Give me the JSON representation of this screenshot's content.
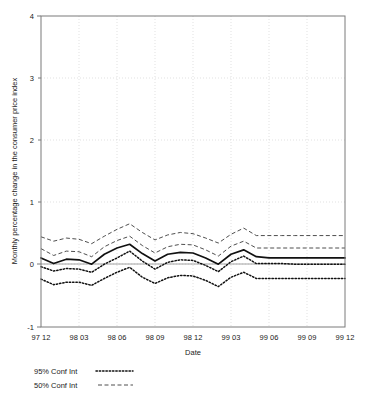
{
  "chart_data": {
    "type": "line",
    "title": "",
    "xlabel": "Date",
    "ylabel": "Monthly percentage change in the consumer price index",
    "ylim": [
      -1,
      4
    ],
    "yticks": [
      "-1",
      "0",
      "1",
      "2",
      "3",
      "4"
    ],
    "ytick_values": [
      -1,
      0,
      1,
      2,
      3,
      4
    ],
    "xticks": [
      "97 12",
      "98 03",
      "98 06",
      "98 09",
      "98 12",
      "99 03",
      "99 06",
      "99 09",
      "99 12"
    ],
    "xtick_values": [
      0,
      3,
      6,
      9,
      12,
      15,
      18,
      21,
      24
    ],
    "xlim": [
      0,
      24
    ],
    "grid": true,
    "legend_position": "below-plot",
    "legend": [
      {
        "label": "95% Conf Int",
        "style": "dotted"
      },
      {
        "label": "50% Conf Int",
        "style": "dashed"
      }
    ],
    "zero_reference_line": 0,
    "x": [
      0,
      1,
      2,
      3,
      4,
      5,
      6,
      7,
      8,
      9,
      10,
      11,
      12,
      13,
      14,
      15,
      16,
      17,
      18,
      19,
      20,
      21,
      22,
      23,
      24
    ],
    "series": [
      {
        "name": "Mean forecast",
        "style": "solid",
        "values": [
          0.11,
          0.02,
          0.09,
          0.08,
          0.01,
          0.17,
          0.27,
          0.33,
          0.18,
          0.06,
          0.17,
          0.2,
          0.19,
          0.11,
          0.01,
          0.17,
          0.24,
          0.13,
          0.11,
          0.11,
          0.11,
          0.11,
          0.11,
          0.11,
          0.11
        ]
      },
      {
        "name": "50% Conf Int upper",
        "style": "dashed",
        "values": [
          0.45,
          0.38,
          0.43,
          0.41,
          0.34,
          0.46,
          0.57,
          0.66,
          0.52,
          0.4,
          0.48,
          0.52,
          0.5,
          0.43,
          0.35,
          0.49,
          0.59,
          0.47,
          0.47,
          0.47,
          0.47,
          0.47,
          0.47,
          0.47,
          0.47
        ]
      },
      {
        "name": "50% Conf Int lower",
        "style": "dashed",
        "values": [
          0.26,
          0.15,
          0.22,
          0.21,
          0.13,
          0.29,
          0.39,
          0.46,
          0.31,
          0.19,
          0.29,
          0.33,
          0.32,
          0.24,
          0.14,
          0.3,
          0.38,
          0.27,
          0.27,
          0.27,
          0.27,
          0.27,
          0.27,
          0.27,
          0.27
        ]
      },
      {
        "name": "95% Conf Int upper",
        "style": "dotted",
        "values": [
          -0.03,
          -0.1,
          -0.06,
          -0.07,
          -0.12,
          0.01,
          0.11,
          0.22,
          0.06,
          -0.07,
          0.04,
          0.08,
          0.07,
          -0.01,
          -0.11,
          0.05,
          0.14,
          0.02,
          0.02,
          0.02,
          0.01,
          0.01,
          0.01,
          0.01,
          0.01
        ]
      },
      {
        "name": "95% Conf Int lower",
        "style": "dotted",
        "values": [
          -0.23,
          -0.32,
          -0.28,
          -0.28,
          -0.33,
          -0.22,
          -0.12,
          -0.04,
          -0.2,
          -0.3,
          -0.21,
          -0.17,
          -0.18,
          -0.25,
          -0.35,
          -0.2,
          -0.12,
          -0.22,
          -0.22,
          -0.22,
          -0.22,
          -0.22,
          -0.22,
          -0.22,
          -0.22
        ]
      }
    ]
  },
  "figure": {
    "ylabel": "Monthly percentage change in the consumer price index",
    "xlabel": "Date",
    "ytick_labels": [
      "4",
      "3",
      "2",
      "1",
      "0",
      "-1"
    ],
    "xtick_labels": [
      "97 12",
      "98 03",
      "98 06",
      "98 09",
      "98 12",
      "99 03",
      "99 06",
      "99 09",
      "99 12"
    ],
    "legend_95_label": "95% Conf Int",
    "legend_50_label": "50% Conf Int"
  },
  "colors": {
    "frame": "#7a7a7a",
    "grid": "#cfcfcf",
    "mean_line": "#111111",
    "conf50": "#3a3a3a",
    "conf95": "#111111",
    "background": "#ffffff"
  }
}
